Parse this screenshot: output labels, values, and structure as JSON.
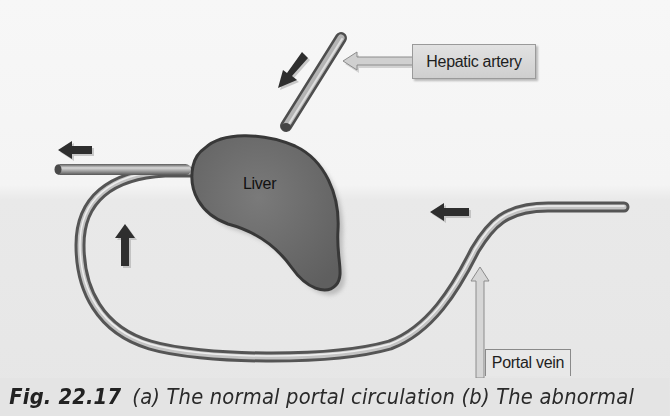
{
  "figure": {
    "labels": {
      "hepatic_artery": "Hepatic artery",
      "liver": "Liver",
      "portal_vein": "Portal vein"
    },
    "caption": {
      "number": "Fig. 22.17",
      "text": "(a) The normal portal circulation (b) The abnormal"
    },
    "flow_arrows": [
      {
        "id": "hepatic-inflow",
        "direction": "down-left"
      },
      {
        "id": "outflow-left",
        "direction": "left"
      },
      {
        "id": "loop-upward",
        "direction": "up"
      },
      {
        "id": "portal-inflow",
        "direction": "left"
      }
    ],
    "colors": {
      "liver_fill": "#6e6e6e",
      "liver_outline": "#3a3a3a",
      "vessel": "#9a9a9a",
      "arrow_dark": "#2e2e2e",
      "callout_arrow": "#c9c9c9"
    }
  }
}
